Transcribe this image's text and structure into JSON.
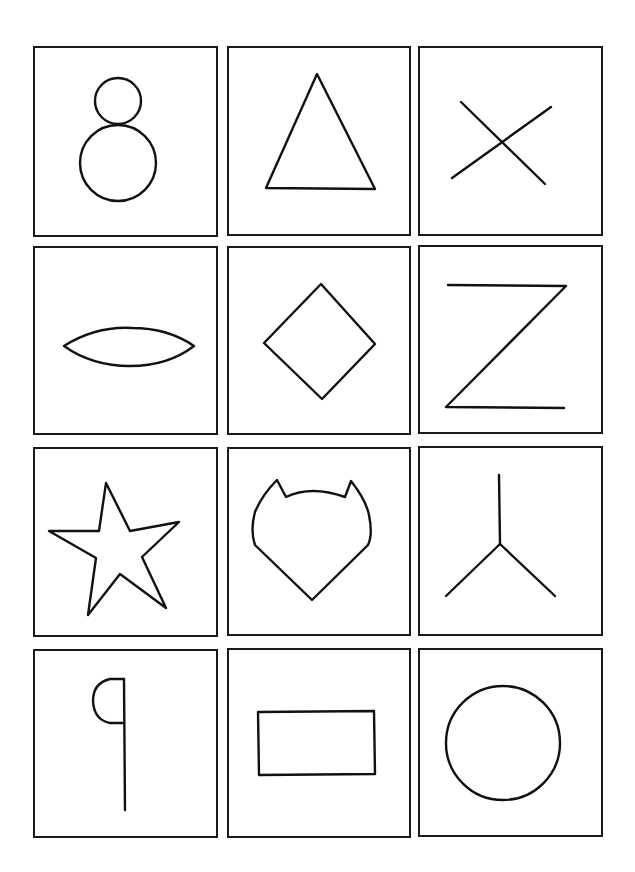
{
  "sheet": {
    "title": "Shape recognition card grid",
    "rows": 4,
    "columns": 3,
    "colors": {
      "background": "#ffffff",
      "line": "#111111",
      "frame": "#1a1a1a"
    }
  },
  "cards": [
    {
      "row": 1,
      "col": 1,
      "shape": "snowman-two-circles",
      "label": "Two stacked circles"
    },
    {
      "row": 1,
      "col": 2,
      "shape": "triangle",
      "label": "Triangle"
    },
    {
      "row": 1,
      "col": 3,
      "shape": "cross-x",
      "label": "Cross"
    },
    {
      "row": 2,
      "col": 1,
      "shape": "lens-ellipse",
      "label": "Lens"
    },
    {
      "row": 2,
      "col": 2,
      "shape": "diamond",
      "label": "Diamond"
    },
    {
      "row": 2,
      "col": 3,
      "shape": "z-zigzag",
      "label": "Z shape"
    },
    {
      "row": 3,
      "col": 1,
      "shape": "star",
      "label": "Five-pointed star"
    },
    {
      "row": 3,
      "col": 2,
      "shape": "cat-head",
      "label": "Cat head outline"
    },
    {
      "row": 3,
      "col": 3,
      "shape": "y-fork",
      "label": "Y fork"
    },
    {
      "row": 4,
      "col": 1,
      "shape": "flag-half-circle",
      "label": "Line with half circle"
    },
    {
      "row": 4,
      "col": 2,
      "shape": "rectangle",
      "label": "Rectangle"
    },
    {
      "row": 4,
      "col": 3,
      "shape": "circle",
      "label": "Circle"
    }
  ]
}
